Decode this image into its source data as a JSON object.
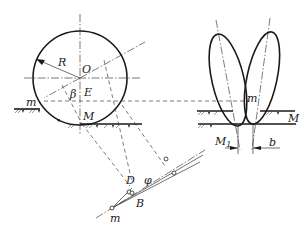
{
  "labels": {
    "R": "R",
    "O": "O",
    "beta": "β",
    "E": "E",
    "M_circle": "M",
    "m_left": "m",
    "m_right": "m",
    "M_right": "M",
    "M1": "M",
    "M1_sub": "1",
    "b": "b",
    "D": "D",
    "B": "B",
    "phi": "φ",
    "m_bottom": "m"
  },
  "colors": {
    "stroke": "#1a1a1a",
    "background": "#ffffff"
  }
}
